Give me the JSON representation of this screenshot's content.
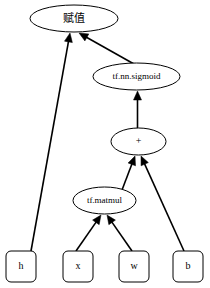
{
  "diagram": {
    "type": "computation-graph",
    "title": "",
    "canvas": {
      "width": 210,
      "height": 288,
      "background": "#ffffff"
    },
    "colors": {
      "stroke": "#000000",
      "fill": "#ffffff",
      "text": "#000000"
    },
    "nodes": [
      {
        "id": "assign",
        "label": "赋值",
        "shape": "ellipse",
        "cx": 74,
        "cy": 18.5,
        "rx": 44,
        "ry": 13.5,
        "font_size": 11
      },
      {
        "id": "sigmoid",
        "label": "tf.nn.sigmoid",
        "shape": "ellipse",
        "cx": 136.5,
        "cy": 76.5,
        "rx": 43.5,
        "ry": 13.5,
        "font_size": 9
      },
      {
        "id": "add",
        "label": "+",
        "shape": "ellipse",
        "cx": 138.5,
        "cy": 141.5,
        "rx": 27.5,
        "ry": 13.5,
        "font_size": 10
      },
      {
        "id": "matmul",
        "label": "tf.matmul",
        "shape": "ellipse",
        "cx": 104.5,
        "cy": 200.5,
        "rx": 31.5,
        "ry": 13.5,
        "font_size": 9
      },
      {
        "id": "h",
        "label": "h",
        "shape": "rounded-rect",
        "x": 6,
        "y": 251,
        "width": 30,
        "height": 31,
        "font_size": 10
      },
      {
        "id": "x",
        "label": "x",
        "shape": "rounded-rect",
        "x": 63,
        "y": 251,
        "width": 30,
        "height": 31,
        "font_size": 10
      },
      {
        "id": "w",
        "label": "w",
        "shape": "rounded-rect",
        "x": 119,
        "y": 251,
        "width": 30,
        "height": 31,
        "font_size": 10
      },
      {
        "id": "b",
        "label": "b",
        "shape": "rounded-rect",
        "x": 173,
        "y": 251,
        "width": 30,
        "height": 31,
        "font_size": 10
      }
    ],
    "edges": [
      {
        "id": "h-to-assign",
        "from": "h",
        "to": "assign",
        "x1": 31,
        "y1": 251,
        "x2": 70,
        "y2": 33
      },
      {
        "id": "sigmoid-to-assign",
        "from": "sigmoid",
        "to": "assign",
        "x1": 134,
        "y1": 64,
        "x2": 79,
        "y2": 33
      },
      {
        "id": "add-to-sigmoid",
        "from": "add",
        "to": "sigmoid",
        "x1": 137.5,
        "y1": 128,
        "x2": 137.5,
        "y2": 91
      },
      {
        "id": "matmul-to-add",
        "from": "matmul",
        "to": "add",
        "x1": 122,
        "y1": 190,
        "x2": 135,
        "y2": 156
      },
      {
        "id": "b-to-add",
        "from": "b",
        "to": "add",
        "x1": 184,
        "y1": 251,
        "x2": 141,
        "y2": 156
      },
      {
        "id": "x-to-matmul",
        "from": "x",
        "to": "matmul",
        "x1": 76,
        "y1": 251,
        "x2": 101,
        "y2": 215
      },
      {
        "id": "w-to-matmul",
        "from": "w",
        "to": "matmul",
        "x1": 132,
        "y1": 251,
        "x2": 107,
        "y2": 215
      }
    ]
  }
}
